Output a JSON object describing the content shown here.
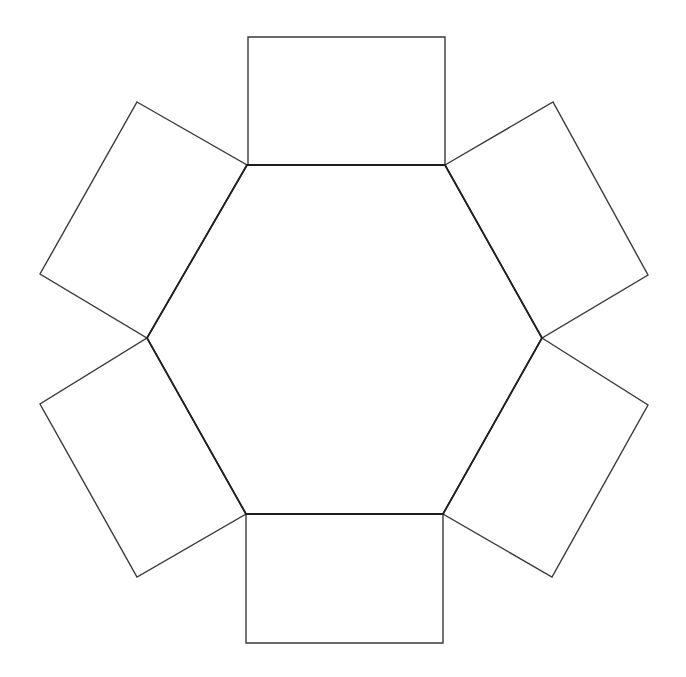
{
  "diagram": {
    "colors": {
      "background": "#ffffff",
      "stroke": "#3a3a3a",
      "hexagon_stroke": "#1e1e1e"
    },
    "hexagon": {
      "points": "247,165 445,165 542,338 443,514 246,514 147,338"
    },
    "rectangles": [
      {
        "name": "top",
        "points": "248,37 445,37 445,165 248,165"
      },
      {
        "name": "upper-right",
        "points": "445,165 553,102 648,275 542,338"
      },
      {
        "name": "lower-right",
        "points": "542,338 648,405 552,577 443,514"
      },
      {
        "name": "bottom",
        "points": "246,514 443,514 443,643 246,643"
      },
      {
        "name": "lower-left",
        "points": "147,338 246,514 137,577 40,404"
      },
      {
        "name": "upper-left",
        "points": "137,102 247,165 147,338 40,274"
      }
    ]
  }
}
